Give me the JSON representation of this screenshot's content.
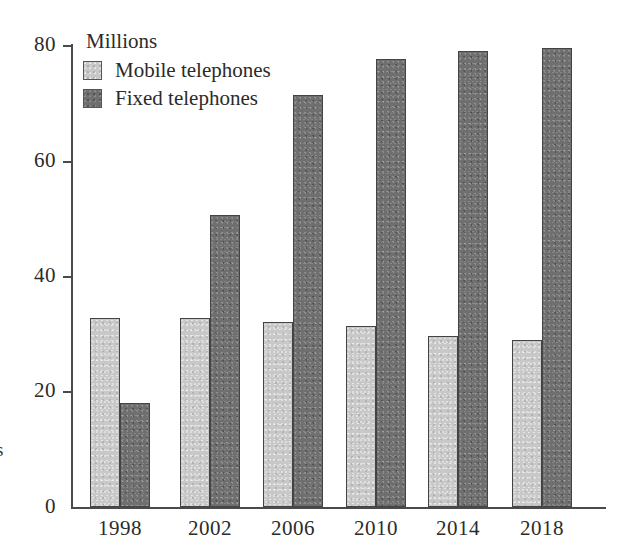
{
  "chart_data": {
    "type": "bar",
    "title": "",
    "subtitle": "",
    "xlabel": "",
    "ylabel": "Millions",
    "axis_title": "Millions",
    "categories": [
      "1998",
      "2002",
      "2006",
      "2010",
      "2014",
      "2018"
    ],
    "series": [
      {
        "name": "Mobile telephones",
        "color": "#c8c8c8",
        "values": [
          32.7,
          32.7,
          32.1,
          31.4,
          29.6,
          28.9
        ]
      },
      {
        "name": "Fixed telephones",
        "color": "#6f6f6f",
        "values": [
          18.0,
          50.5,
          71.3,
          77.6,
          78.9,
          79.5
        ]
      }
    ],
    "ylim": [
      0,
      80
    ],
    "y_ticks": [
      0,
      20,
      40,
      60,
      80
    ],
    "y_tick_labels": [
      "0",
      "20",
      "40",
      "60",
      "80"
    ],
    "grid": false,
    "legend_position": "top-left",
    "legend_entries": [
      "Mobile telephones",
      "Fixed telephones"
    ]
  },
  "legend": {
    "items": [
      {
        "label": "Mobile telephones",
        "swatch": "legend-swatch-mobile"
      },
      {
        "label": "Fixed telephones",
        "swatch": "legend-swatch-fixed"
      }
    ]
  },
  "axes": {
    "y_title": "Millions",
    "y_tick_labels": [
      "80",
      "60",
      "40",
      "20",
      "0"
    ],
    "x_tick_labels": [
      "1998",
      "2002",
      "2006",
      "2010",
      "2014",
      "2018"
    ]
  },
  "margin_text": "s"
}
